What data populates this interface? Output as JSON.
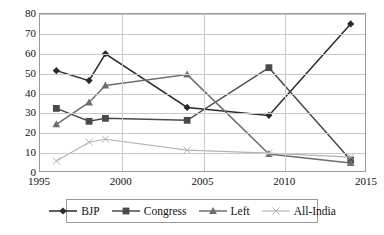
{
  "chart_data": {
    "type": "line",
    "title": "",
    "xlabel": "",
    "ylabel": "",
    "xlim": [
      1995,
      2015
    ],
    "ylim": [
      0,
      80
    ],
    "grid": true,
    "legend_position": "bottom",
    "x": [
      1996,
      1998,
      1999,
      2004,
      2009,
      2014
    ],
    "xticks": [
      "1995",
      "2000",
      "2005",
      "2010",
      "2015"
    ],
    "xtick_values": [
      1995,
      2000,
      2005,
      2010,
      2015
    ],
    "yticks": [
      "0",
      "10",
      "20",
      "30",
      "40",
      "50",
      "60",
      "70",
      "80"
    ],
    "ytick_values": [
      0,
      10,
      20,
      30,
      40,
      50,
      60,
      70,
      80
    ],
    "series": [
      {
        "name": "BJP",
        "marker": "diamond",
        "color": "#2b2b2b",
        "values": [
          51.5,
          46.5,
          60.0,
          33.0,
          29.0,
          75.0
        ]
      },
      {
        "name": "Congress",
        "marker": "square",
        "color": "#4a4a4a",
        "values": [
          32.5,
          26.0,
          27.5,
          26.5,
          53.0,
          6.5
        ]
      },
      {
        "name": "Left",
        "marker": "triangle",
        "color": "#6e6e6e",
        "values": [
          24.5,
          35.5,
          44.0,
          49.5,
          9.5,
          5.0
        ]
      },
      {
        "name": "All-India",
        "marker": "x",
        "color": "#b3b3b3",
        "values": [
          6.0,
          15.5,
          17.0,
          11.5,
          10.0,
          8.0
        ]
      }
    ]
  },
  "legend": {
    "items": [
      {
        "label": "BJP"
      },
      {
        "label": "Congress"
      },
      {
        "label": "Left"
      },
      {
        "label": "All-India"
      }
    ]
  }
}
